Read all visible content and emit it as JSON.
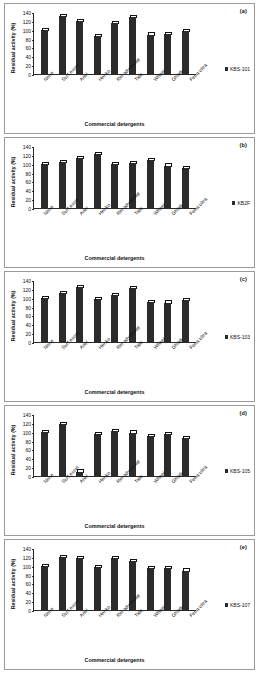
{
  "figure": {
    "panels": [
      "a",
      "b",
      "c",
      "d",
      "e"
    ],
    "axis_title_x": "Commercial detergents",
    "axis_title_y": "Residual activity (%)",
    "yticks": [
      0,
      20,
      40,
      60,
      80,
      100,
      120,
      140
    ],
    "categories": [
      "None",
      "Surf excel",
      "Ariel",
      "Henko",
      "Rin advanced",
      "Tide",
      "Wheel",
      "Ghadi",
      "Fena ultra"
    ]
  },
  "chart_data": [
    {
      "type": "bar",
      "panel": "(a)",
      "title": "",
      "xlabel": "Commercial detergents",
      "ylabel": "Residual activity (%)",
      "ylim": [
        0,
        140
      ],
      "legend": "KBS-101",
      "legend_position": "right",
      "grid": false,
      "categories": [
        "None",
        "Surf excel",
        "Ariel",
        "Henko",
        "Rin advanced",
        "Tide",
        "Wheel",
        "Ghadi",
        "Fena ultra"
      ],
      "values": [
        100,
        131,
        119,
        85,
        115,
        128,
        89,
        91,
        97
      ]
    },
    {
      "type": "bar",
      "panel": "(b)",
      "title": "",
      "xlabel": "Commercial detergents",
      "ylabel": "Residual activity (%)",
      "ylim": [
        0,
        140
      ],
      "legend": "KB2F",
      "legend_position": "right",
      "grid": false,
      "categories": [
        "None",
        "Surf excel",
        "Ariel",
        "Henko",
        "Rin advanced",
        "Tide",
        "Wheel",
        "Ghadi",
        "Fena ultra"
      ],
      "values": [
        99,
        104,
        113,
        121,
        99,
        102,
        108,
        96,
        90
      ]
    },
    {
      "type": "bar",
      "panel": "(c)",
      "title": "",
      "xlabel": "Commercial detergents",
      "ylabel": "Residual activity (%)",
      "ylim": [
        0,
        140
      ],
      "legend": "KBS-103",
      "legend_position": "right",
      "grid": false,
      "categories": [
        "None",
        "Surf excel",
        "Ariel",
        "Henko",
        "Rin advanced",
        "Tide",
        "Wheel",
        "Ghadi",
        "Fena ultra"
      ],
      "values": [
        99,
        111,
        124,
        97,
        106,
        121,
        91,
        89,
        94
      ]
    },
    {
      "type": "bar",
      "panel": "(d)",
      "title": "",
      "xlabel": "Commercial detergents",
      "ylabel": "Residual activity (%)",
      "ylim": [
        0,
        140
      ],
      "legend": "KBS-105",
      "legend_position": "right",
      "grid": false,
      "categories": [
        "None",
        "Surf excel",
        "Ariel",
        "Henko",
        "Rin advanced",
        "Tide",
        "Wheel",
        "Ghadi",
        "Fena ultra"
      ],
      "values": [
        99,
        118,
        10,
        95,
        101,
        98,
        91,
        95,
        85
      ]
    },
    {
      "type": "bar",
      "panel": "(e)",
      "title": "",
      "xlabel": "Commercial detergents",
      "ylabel": "Residual activity (%)",
      "ylim": [
        0,
        140
      ],
      "legend": "KBS-107",
      "legend_position": "right",
      "grid": false,
      "categories": [
        "None",
        "Surf excel",
        "Ariel",
        "Henko",
        "Rin advanced",
        "Tide",
        "Wheel",
        "Ghadi",
        "Fena ultra"
      ],
      "values": [
        99,
        120,
        117,
        97,
        117,
        111,
        95,
        94,
        89
      ]
    }
  ],
  "colors": {
    "bar": "#2b2b2b",
    "axis": "#2a2a2a",
    "panel_border": "#9a9a9a",
    "background": "#ffffff"
  }
}
